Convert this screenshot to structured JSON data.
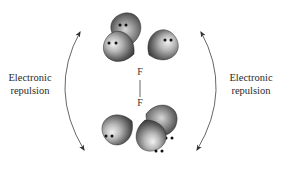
{
  "diagram": {
    "title": "",
    "left_label": {
      "line1": "Electronic",
      "line2": "repulsion"
    },
    "right_label": {
      "line1": "Electronic",
      "line2": "repulsion"
    },
    "atoms": {
      "top": "F",
      "bottom": "F"
    },
    "bond": "single",
    "lone_pairs": {
      "top_atom": 3,
      "bottom_atom": 3,
      "electrons_per_pair": 2
    },
    "arrows": [
      {
        "side": "left",
        "type": "double-headed curved"
      },
      {
        "side": "right",
        "type": "double-headed curved"
      }
    ],
    "colors": {
      "lobe_dark": "#2b2b2b",
      "lobe_light": "#e8e8e8",
      "electron_dot": "#111111",
      "arrow": "#444444",
      "text": "#2a2a2a"
    }
  }
}
